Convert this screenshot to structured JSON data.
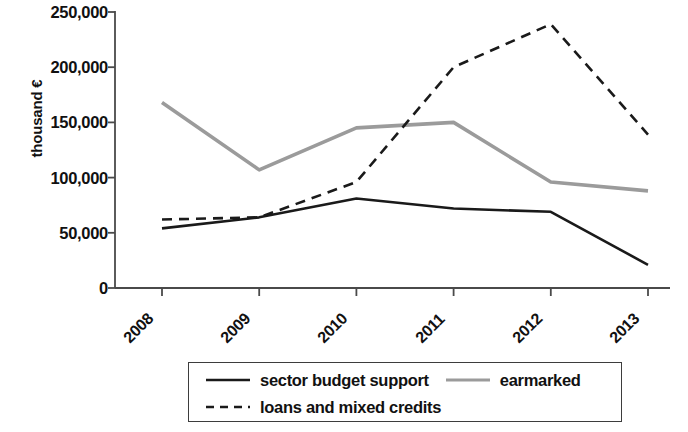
{
  "chart_data": {
    "type": "line",
    "title": "",
    "subtitle": "",
    "xlabel": "",
    "ylabel": "thousand €",
    "categories": [
      "2008",
      "2009",
      "2010",
      "2011",
      "2012",
      "2013"
    ],
    "ylim": [
      0,
      250000
    ],
    "yticks": [
      0,
      50000,
      100000,
      150000,
      200000,
      250000
    ],
    "ytick_labels": [
      "0",
      "50,000",
      "100,000",
      "150,000",
      "200,000",
      "250,000"
    ],
    "grid": false,
    "legend_position": "bottom",
    "series": [
      {
        "name": "sector budget support",
        "style": "solid",
        "color": "#1a1a1a",
        "values": [
          54000,
          64000,
          81000,
          72000,
          69000,
          21000
        ]
      },
      {
        "name": "earmarked",
        "style": "solid",
        "color": "#9b9b9b",
        "values": [
          168000,
          107000,
          145000,
          150000,
          96000,
          88000
        ]
      },
      {
        "name": "loans and mixed credits",
        "style": "dashed",
        "color": "#1a1a1a",
        "values": [
          62000,
          64000,
          96000,
          200000,
          239000,
          139000
        ]
      }
    ]
  },
  "legend": {
    "items": [
      {
        "label": "sector budget support",
        "swatch": "solid-black-line-swatch"
      },
      {
        "label": "earmarked",
        "swatch": "solid-gray-line-swatch"
      },
      {
        "label": "loans and mixed credits",
        "swatch": "dashed-black-line-swatch"
      }
    ]
  },
  "axes": {
    "y_title": "thousand €"
  }
}
